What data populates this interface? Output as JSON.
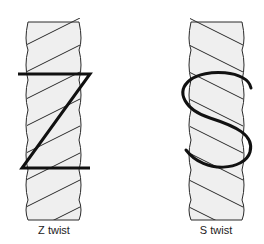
{
  "figure": {
    "panels": [
      {
        "id": "z",
        "label": "Z twist",
        "letter": "Z"
      },
      {
        "id": "s",
        "label": "S twist",
        "letter": "S"
      }
    ],
    "colors": {
      "rope_fill": "#efefef",
      "rope_line": "#2a2a2a",
      "letter": "#111111"
    }
  }
}
